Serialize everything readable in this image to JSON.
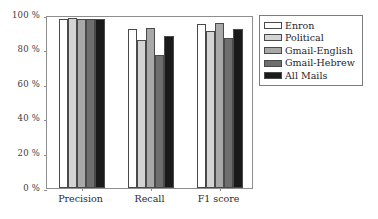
{
  "chart_data": {
    "type": "bar",
    "title": "",
    "subtitle": "",
    "xlabel": "",
    "ylabel": "",
    "categories": [
      "Precision",
      "Recall",
      "F1 score"
    ],
    "series": [
      {
        "name": "Enron",
        "color": "#ffffff",
        "values": [
          97.5,
          92.0,
          94.8
        ]
      },
      {
        "name": "Political",
        "color": "#d4d4d4",
        "values": [
          98.0,
          85.8,
          91.0
        ]
      },
      {
        "name": "Gmail-English",
        "color": "#a8a8a8",
        "values": [
          97.8,
          92.5,
          95.5
        ]
      },
      {
        "name": "Gmail-Hebrew",
        "color": "#6e6e6e",
        "values": [
          97.8,
          77.0,
          86.5
        ]
      },
      {
        "name": "All Mails",
        "color": "#1a1a1a",
        "values": [
          97.8,
          88.0,
          92.2
        ]
      }
    ],
    "ylim": [
      0,
      100
    ],
    "yticks": [
      0,
      20,
      40,
      60,
      80,
      100
    ],
    "ytick_labels": [
      "0 %",
      "20 %",
      "40 %",
      "60 %",
      "80 %",
      "100 %"
    ],
    "grid": false,
    "legend_position": "right-outside"
  },
  "legend": {
    "items": [
      {
        "label": "Enron"
      },
      {
        "label": "Political"
      },
      {
        "label": "Gmail-English"
      },
      {
        "label": "Gmail-Hebrew"
      },
      {
        "label": "All Mails"
      }
    ]
  }
}
